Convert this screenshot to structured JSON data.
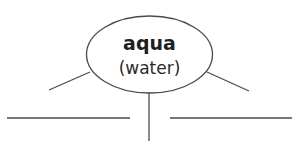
{
  "diagram": {
    "type": "word-web",
    "center": {
      "word": "aqua",
      "meaning": "(water)"
    },
    "branches": [
      {
        "id": "left-diagonal",
        "label": ""
      },
      {
        "id": "right-diagonal",
        "label": ""
      },
      {
        "id": "center-vertical",
        "label": ""
      }
    ],
    "answer_lines": [
      {
        "id": "left-blank",
        "value": ""
      },
      {
        "id": "right-blank",
        "value": ""
      }
    ],
    "colors": {
      "line": "#4a4a4a",
      "text": "#1f1f1f",
      "background": "#ffffff"
    }
  }
}
